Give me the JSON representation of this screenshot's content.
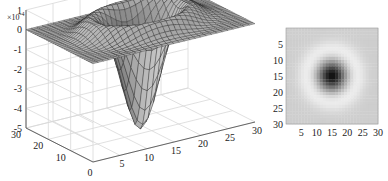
{
  "chart_data": [
    {
      "type": "surface",
      "title": "",
      "description": "3D mesh surface of a Mexican-hat (negative Gaussian well) centered at (15,15) over a 30x30 grid",
      "xlabel": "",
      "ylabel": "",
      "zlabel": "",
      "x_ticks": [
        "0",
        "5",
        "10",
        "15",
        "20",
        "25",
        "30"
      ],
      "y_ticks": [
        "0",
        "10",
        "20",
        "30"
      ],
      "z_ticks": [
        "1",
        "0",
        "-1",
        "-2",
        "-3",
        "-4",
        "-5"
      ],
      "z_exponent": "×10⁻⁴",
      "xlim": [
        0,
        30
      ],
      "ylim": [
        0,
        30
      ],
      "zlim": [
        -0.0005,
        0.0001
      ],
      "grid": true,
      "center": [
        15,
        15
      ],
      "min_value": -0.0005,
      "rim_value": 3e-05,
      "edge_value": 0
    },
    {
      "type": "heatmap",
      "title": "",
      "colormap": "gray",
      "x_ticks": [
        "5",
        "10",
        "15",
        "20",
        "25",
        "30"
      ],
      "y_ticks": [
        "5",
        "10",
        "15",
        "20",
        "25",
        "30"
      ],
      "xlim": [
        0,
        30
      ],
      "ylim": [
        0,
        30
      ],
      "y_axis_reversed": true,
      "center": [
        15,
        15
      ],
      "description": "Top-down grayscale view of the same surface: dark core at (15,15), bright ring around it, mid-gray background"
    }
  ],
  "labels": {
    "surf_exponent": "×10",
    "surf_exponent_power": "-4"
  }
}
